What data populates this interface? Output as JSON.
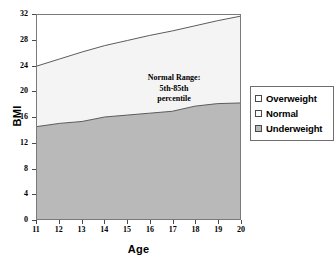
{
  "chart_data": {
    "type": "area",
    "title": "",
    "xlabel": "Age",
    "ylabel": "BMI",
    "xlim": [
      11,
      20
    ],
    "ylim": [
      0,
      32
    ],
    "grid": false,
    "legend_position": "right",
    "x": [
      11,
      12,
      13,
      14,
      15,
      16,
      17,
      18,
      19,
      20
    ],
    "xticks": [
      "11",
      "12",
      "13",
      "14",
      "15",
      "16",
      "17",
      "18",
      "19",
      "20"
    ],
    "yticks": [
      "0",
      "4",
      "8",
      "12",
      "16",
      "20",
      "24",
      "28",
      "32"
    ],
    "annotation": {
      "line1": "Normal Range:",
      "line2": "5th-85th",
      "line3": "percentile"
    },
    "series": [
      {
        "name": "Underweight",
        "description": "5th percentile boundary - region below is Underweight",
        "color": "#b9b9b9",
        "values": [
          14.5,
          15.0,
          15.3,
          16.0,
          16.3,
          16.6,
          16.9,
          17.7,
          18.1,
          18.2
        ]
      },
      {
        "name": "Normal",
        "description": "85th percentile boundary - band between 5th and 85th is Normal",
        "color": "#f5f5f5",
        "values": [
          24.0,
          25.1,
          26.2,
          27.2,
          28.0,
          28.8,
          29.5,
          30.3,
          31.1,
          31.8
        ]
      },
      {
        "name": "Overweight",
        "description": "region above the 85th percentile curve",
        "color": "#ffffff",
        "values": [
          32,
          32,
          32,
          32,
          32,
          32,
          32,
          32,
          32,
          32
        ]
      }
    ],
    "legend": [
      {
        "label": "Overweight",
        "swatch": "#ffffff"
      },
      {
        "label": "Normal",
        "swatch": "#fafafa"
      },
      {
        "label": "Underweight",
        "swatch": "#b9b9b9"
      }
    ]
  },
  "colors": {
    "underweight_fill": "#b9b9b9",
    "normal_fill": "#f4f4f4",
    "overweight_fill": "#ffffff",
    "curve_stroke": "#5a5a5a",
    "frame": "#7a7a7a",
    "text": "#000000"
  }
}
